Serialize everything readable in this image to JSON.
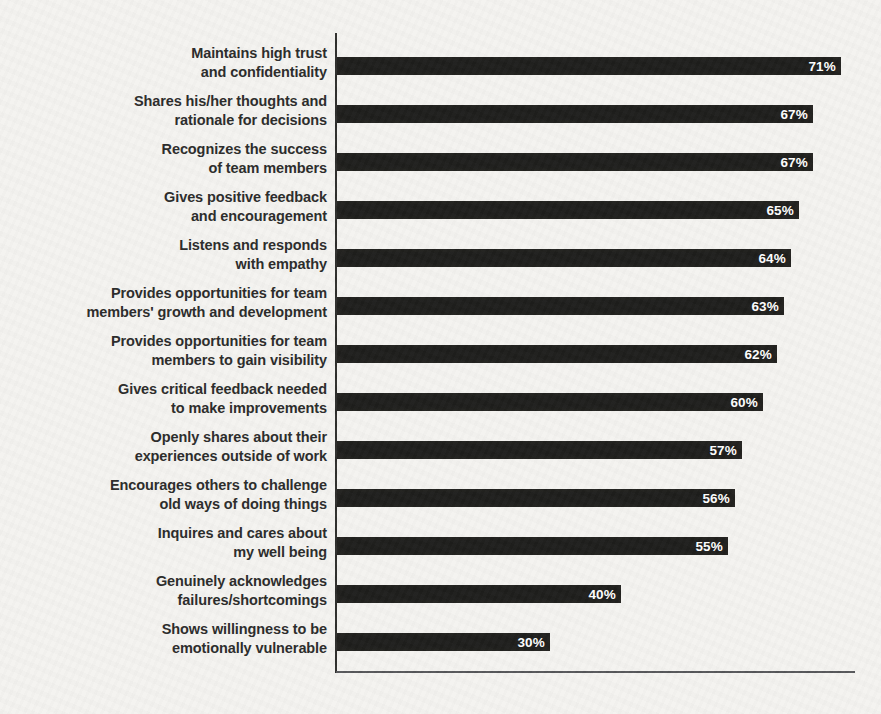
{
  "chart_data": {
    "type": "bar",
    "orientation": "horizontal",
    "title": "",
    "xlabel": "",
    "ylabel": "",
    "legend": null,
    "grid": false,
    "axis_tick_labels_visible": false,
    "value_labels_position": "inside-bar-end",
    "value_suffix": "%",
    "xlim": [
      0,
      77
    ],
    "categories": [
      "Maintains high trust\nand confidentiality",
      "Shares his/her thoughts and\nrationale for decisions",
      "Recognizes the success\nof team members",
      "Gives positive feedback\nand encouragement",
      "Listens and responds\nwith empathy",
      "Provides opportunities for team\nmembers' growth and development",
      "Provides opportunities for team\nmembers to gain visibility",
      "Gives critical feedback needed\nto make improvements",
      "Openly shares about their\nexperiences outside of work",
      "Encourages others to challenge\nold ways of doing things",
      "Inquires and cares about\nmy well being",
      "Genuinely acknowledges\nfailures/shortcomings",
      "Shows willingness to be\nemotionally vulnerable"
    ],
    "values": [
      71,
      67,
      67,
      65,
      64,
      63,
      62,
      60,
      57,
      56,
      55,
      40,
      30
    ]
  },
  "colors": {
    "background": "#f4f3f0",
    "bar": "#1e1e1c",
    "category_label": "#2b2b2a",
    "value_label": "#ffffff",
    "y_axis_line": "#2e2e2c",
    "x_axis_line": "#56575a"
  }
}
